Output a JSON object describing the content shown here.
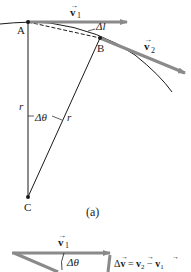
{
  "figure": {
    "part_a": {
      "point_a": "A",
      "point_b": "B",
      "point_c": "C",
      "v1_label": "v",
      "v1_sub": "1",
      "v2_label": "v",
      "v2_sub": "2",
      "arc_label": "Δl",
      "radius_label_left": "r",
      "radius_label_right": "r",
      "angle_label": "Δθ",
      "caption": "(a)"
    },
    "part_b": {
      "v1_label": "v",
      "v1_sub": "1",
      "angle_label": "Δθ",
      "delta_v_equation": "Δv = v₂ − v₁",
      "delta_prefix": "Δ",
      "v": "v",
      "eq": " = ",
      "minus": " − ",
      "sub2": "2",
      "sub1": "1"
    },
    "colors": {
      "vector": "#8a8a8a",
      "line": "#1a1a1a"
    }
  }
}
